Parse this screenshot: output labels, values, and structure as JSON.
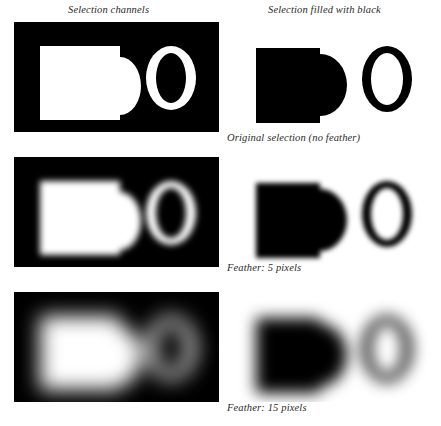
{
  "figure": {
    "background": "#ffffff",
    "ink": "#000000",
    "text_color": "#2b2b2b"
  },
  "columns": [
    {
      "id": "selection-channels",
      "heading": "Selection channels"
    },
    {
      "id": "selection-filled",
      "heading": "Selection filled with black"
    }
  ],
  "rows": [
    {
      "id": "row-no-feather",
      "caption": "Original selection (no feather)",
      "feather_px": 0,
      "blur_channel": 0,
      "blur_filled": 0
    },
    {
      "id": "row-feather-5",
      "caption": "Feather: 5 pixels",
      "feather_px": 5,
      "blur_channel": 3.2,
      "blur_filled": 2.4
    },
    {
      "id": "row-feather-15",
      "caption": "Feather: 15 pixels",
      "feather_px": 15,
      "blur_channel": 10,
      "blur_filled": 7.5
    }
  ],
  "shapes": {
    "channel_panel": {
      "panel_fill": "#000000",
      "shape_fill": "#ffffff",
      "rect": {
        "x": 26,
        "y": 24,
        "width": 80,
        "height": 74
      },
      "bump_ellipse": {
        "cx": 106,
        "cy": 64,
        "rx": 21,
        "ry": 29
      },
      "letter_o": {
        "cx": 157,
        "cy": 56,
        "rx": 25,
        "ry": 32,
        "inner_rx": 15,
        "inner_ry": 25
      }
    },
    "filled_panel": {
      "panel_fill": "#ffffff",
      "shape_fill": "#000000",
      "rect": {
        "x": 28,
        "y": 26,
        "width": 64,
        "height": 75
      },
      "bump_ellipse": {
        "cx": 92,
        "cy": 63,
        "rx": 27,
        "ry": 31
      },
      "letter_o": {
        "cx": 159,
        "cy": 57,
        "rx": 25,
        "ry": 33,
        "inner_rx": 16,
        "inner_ry": 26
      }
    }
  }
}
